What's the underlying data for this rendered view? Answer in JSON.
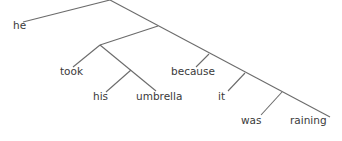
{
  "diagram": {
    "type": "syntax-tree",
    "line_color": "#6b6b6b",
    "text_color": "#3a3a3a",
    "words": [
      {
        "id": "he",
        "text": "he",
        "x": 13,
        "y": 21
      },
      {
        "id": "took",
        "text": "took",
        "x": 60,
        "y": 67
      },
      {
        "id": "his",
        "text": "his",
        "x": 93,
        "y": 92
      },
      {
        "id": "umbrella",
        "text": "umbrella",
        "x": 136,
        "y": 92
      },
      {
        "id": "because",
        "text": "because",
        "x": 171,
        "y": 67
      },
      {
        "id": "it",
        "text": "it",
        "x": 218,
        "y": 92
      },
      {
        "id": "was",
        "text": "was",
        "x": 241,
        "y": 116
      },
      {
        "id": "raining",
        "text": "raining",
        "x": 290,
        "y": 116
      }
    ],
    "edges": [
      {
        "x1": 110,
        "y1": 0,
        "x2": 23,
        "y2": 22
      },
      {
        "x1": 110,
        "y1": 0,
        "x2": 330,
        "y2": 117
      },
      {
        "x1": 158,
        "y1": 26,
        "x2": 100,
        "y2": 45
      },
      {
        "x1": 100,
        "y1": 45,
        "x2": 73,
        "y2": 67
      },
      {
        "x1": 100,
        "y1": 45,
        "x2": 156,
        "y2": 91
      },
      {
        "x1": 131,
        "y1": 70,
        "x2": 106,
        "y2": 92
      },
      {
        "x1": 209,
        "y1": 54,
        "x2": 196,
        "y2": 67
      },
      {
        "x1": 245,
        "y1": 73,
        "x2": 228,
        "y2": 91
      },
      {
        "x1": 282,
        "y1": 92,
        "x2": 261,
        "y2": 115
      }
    ]
  }
}
